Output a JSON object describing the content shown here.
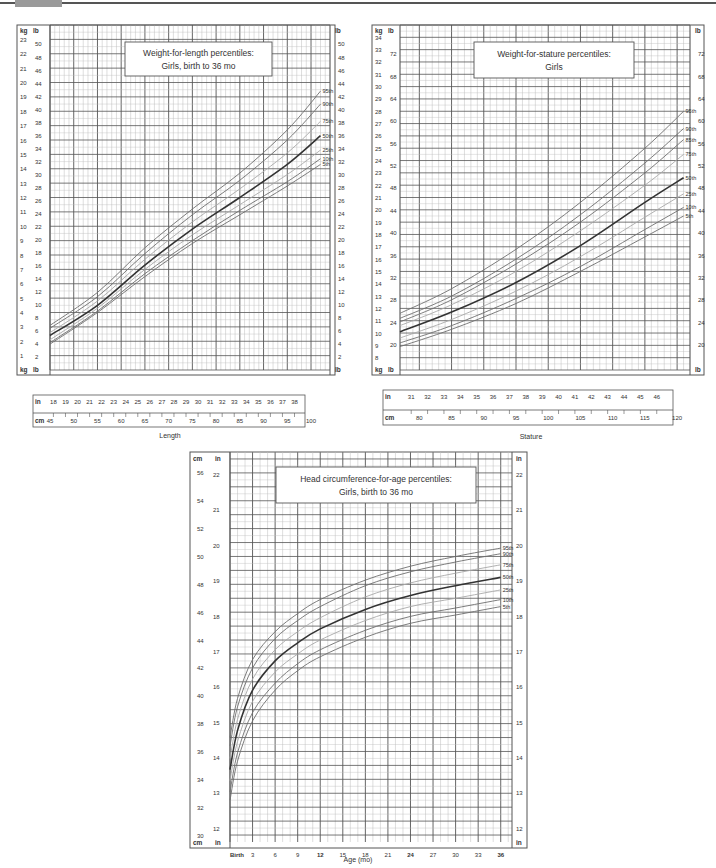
{
  "header": {
    "bar_color": "#555555",
    "tab_color": "#9a9a9a"
  },
  "colors": {
    "grid": "#555555",
    "grid_minor": "#bdbdbd",
    "line_dark": "#333333",
    "line_mid": "#6e6e6e",
    "line_light": "#a8a8a8",
    "text": "#333333"
  },
  "chart_data": [
    {
      "id": "wfl",
      "type": "line",
      "title": "Weight-for-length percentiles:",
      "subtitle": "Girls, birth to 36 mo",
      "xlabel": "Length",
      "ylabel_left": "kg",
      "ylabel_left2": "lb",
      "ylabel_right": "lb",
      "xlabel_top_unit": "in",
      "xlabel_bottom_unit": "cm",
      "xlim": [
        45,
        104
      ],
      "ylim": [
        0,
        24
      ],
      "kg_ticks": [
        1,
        2,
        3,
        4,
        5,
        6,
        7,
        8,
        9,
        10,
        11,
        12,
        13,
        14,
        15,
        16,
        17,
        18,
        19,
        20,
        21,
        22,
        23
      ],
      "lb_ticks": [
        2,
        4,
        6,
        8,
        10,
        12,
        14,
        16,
        18,
        20,
        22,
        24,
        26,
        28,
        30,
        32,
        34,
        36,
        38,
        40,
        42,
        44,
        46,
        48,
        50
      ],
      "in_ticks": [
        18,
        19,
        20,
        21,
        22,
        23,
        24,
        25,
        26,
        27,
        28,
        29,
        30,
        31,
        32,
        33,
        34,
        35,
        36,
        37,
        38,
        39,
        40
      ],
      "cm_ticks": [
        45,
        50,
        55,
        60,
        65,
        70,
        75,
        80,
        85,
        90,
        95,
        100
      ],
      "x": [
        45,
        55,
        65,
        75,
        85,
        95,
        102
      ],
      "series": [
        {
          "name": "95th",
          "values": [
            3.1,
            5.4,
            8.5,
            11.2,
            13.7,
            16.7,
            19.4
          ]
        },
        {
          "name": "90th",
          "values": [
            2.9,
            5.1,
            8.1,
            10.8,
            13.2,
            16.0,
            18.5
          ]
        },
        {
          "name": "75th",
          "values": [
            2.6,
            4.8,
            7.7,
            10.3,
            12.6,
            15.1,
            17.3
          ]
        },
        {
          "name": "50th",
          "values": [
            2.4,
            4.5,
            7.3,
            9.8,
            12.0,
            14.3,
            16.3
          ]
        },
        {
          "name": "25th",
          "values": [
            2.1,
            4.3,
            7.0,
            9.4,
            11.5,
            13.6,
            15.3
          ]
        },
        {
          "name": "10th",
          "values": [
            1.9,
            4.1,
            6.7,
            9.0,
            11.1,
            13.1,
            14.7
          ]
        },
        {
          "name": "5th",
          "values": [
            1.8,
            4.0,
            6.5,
            8.8,
            10.8,
            12.8,
            14.3
          ]
        }
      ]
    },
    {
      "id": "wfs",
      "type": "line",
      "title": "Weight-for-stature percentiles:",
      "subtitle": "Girls",
      "xlabel": "Stature",
      "ylabel_left": "kg",
      "ylabel_left2": "lb",
      "ylabel_right": "lb",
      "xlabel_top_unit": "in",
      "xlabel_bottom_unit": "cm",
      "xlim": [
        77,
        122
      ],
      "ylim": [
        7,
        35
      ],
      "kg_ticks": [
        8,
        9,
        10,
        11,
        12,
        13,
        14,
        15,
        16,
        17,
        18,
        19,
        20,
        21,
        22,
        23,
        24,
        25,
        26,
        27,
        28,
        29,
        30,
        31,
        32,
        33,
        34
      ],
      "lb_ticks": [
        20,
        24,
        28,
        32,
        36,
        40,
        44,
        48,
        52,
        56,
        60,
        64,
        68,
        72,
        76
      ],
      "in_ticks": [
        31,
        32,
        33,
        34,
        35,
        36,
        37,
        38,
        39,
        40,
        41,
        42,
        43,
        44,
        45,
        46,
        47
      ],
      "cm_ticks": [
        80,
        85,
        90,
        95,
        100,
        105,
        110,
        115,
        120
      ],
      "x": [
        77,
        85,
        95,
        105,
        115,
        121
      ],
      "series": [
        {
          "name": "95th",
          "values": [
            11.6,
            13.6,
            16.8,
            20.6,
            25.0,
            28.0
          ]
        },
        {
          "name": "90th",
          "values": [
            11.2,
            13.0,
            16.0,
            19.6,
            23.8,
            26.6
          ]
        },
        {
          "name": "85th",
          "values": [
            10.9,
            12.7,
            15.6,
            19.0,
            23.0,
            25.7
          ]
        },
        {
          "name": "75th",
          "values": [
            10.6,
            12.3,
            15.0,
            18.3,
            22.0,
            24.5
          ]
        },
        {
          "name": "50th",
          "values": [
            10.1,
            11.7,
            14.1,
            17.1,
            20.6,
            22.6
          ]
        },
        {
          "name": "25th",
          "values": [
            9.6,
            11.1,
            13.4,
            16.2,
            19.4,
            21.3
          ]
        },
        {
          "name": "10th",
          "values": [
            9.2,
            10.6,
            12.8,
            15.4,
            18.4,
            20.2
          ]
        },
        {
          "name": "5th",
          "values": [
            8.9,
            10.3,
            12.4,
            15.0,
            17.8,
            19.5
          ]
        }
      ]
    },
    {
      "id": "hc",
      "type": "line",
      "title": "Head circumference-for-age percentiles:",
      "subtitle": "Girls, birth to 36 mo",
      "xlabel": "Age (mo)",
      "ylabel_left": "cm",
      "ylabel_left2": "in",
      "ylabel_right": "in",
      "xlim": [
        0,
        37.5
      ],
      "ylim": [
        29.5,
        57.5
      ],
      "cm_ticks": [
        30,
        32,
        34,
        36,
        38,
        40,
        42,
        44,
        46,
        48,
        50,
        52,
        54,
        56
      ],
      "in_ticks": [
        12,
        13,
        14,
        15,
        16,
        17,
        18,
        19,
        20,
        21,
        22
      ],
      "age_ticks": [
        "Birth",
        "3",
        "6",
        "9",
        "12",
        "15",
        "18",
        "21",
        "24",
        "27",
        "30",
        "33",
        "36"
      ],
      "age_bold": [
        "Birth",
        "12",
        "24",
        "36"
      ],
      "x": [
        0,
        1,
        3,
        6,
        9,
        12,
        18,
        24,
        30,
        36
      ],
      "series": [
        {
          "name": "95th",
          "values": [
            37.0,
            39.8,
            42.6,
            44.6,
            45.9,
            46.9,
            48.3,
            49.3,
            50.0,
            50.6
          ]
        },
        {
          "name": "90th",
          "values": [
            36.4,
            39.2,
            42.0,
            44.1,
            45.4,
            46.4,
            47.9,
            48.9,
            49.6,
            50.2
          ]
        },
        {
          "name": "75th",
          "values": [
            35.5,
            38.3,
            41.2,
            43.3,
            44.6,
            45.6,
            47.1,
            48.1,
            48.8,
            49.4
          ]
        },
        {
          "name": "50th",
          "values": [
            34.7,
            37.5,
            40.4,
            42.5,
            43.8,
            44.8,
            46.2,
            47.2,
            47.9,
            48.5
          ]
        },
        {
          "name": "25th",
          "values": [
            33.9,
            36.7,
            39.6,
            41.7,
            43.0,
            44.0,
            45.4,
            46.4,
            47.0,
            47.6
          ]
        },
        {
          "name": "10th",
          "values": [
            33.1,
            35.9,
            38.8,
            40.9,
            42.3,
            43.3,
            44.7,
            45.7,
            46.3,
            46.9
          ]
        },
        {
          "name": "5th",
          "values": [
            32.5,
            35.3,
            38.2,
            40.4,
            41.8,
            42.8,
            44.2,
            45.2,
            45.8,
            46.4
          ]
        }
      ]
    }
  ],
  "layout": [
    {
      "chart": "wfl",
      "frame": [
        17,
        25,
        335,
        375
      ],
      "plot": [
        50,
        25,
        330,
        370
      ],
      "title_box": [
        125,
        42,
        272,
        76
      ],
      "inch_axis": [
        33,
        400,
        305,
        413
      ],
      "cm_axis": [
        33,
        413,
        305,
        427
      ],
      "xlabel_pos": [
        170,
        438
      ]
    },
    {
      "chart": "wfs",
      "frame": [
        372,
        25,
        704,
        375
      ],
      "plot": [
        400,
        25,
        690,
        370
      ],
      "title_box": [
        474,
        42,
        634,
        78
      ],
      "inch_axis": [
        383,
        395,
        673,
        410
      ],
      "cm_axis": [
        383,
        410,
        673,
        425
      ],
      "xlabel_pos": [
        531,
        439
      ]
    },
    {
      "chart": "hc",
      "frame": [
        190,
        452,
        527,
        848
      ],
      "plot": [
        230,
        452,
        512,
        842
      ],
      "title_box": [
        276,
        467,
        476,
        503
      ],
      "xlabel_pos": [
        358,
        862
      ]
    }
  ],
  "line_styles": {
    "95th": "mid",
    "90th": "mid",
    "85th": "mid",
    "75th": "light",
    "50th": "dark",
    "25th": "light",
    "10th": "mid",
    "5th": "mid"
  }
}
